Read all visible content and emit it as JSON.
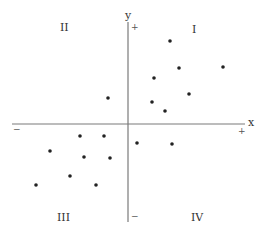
{
  "diagram": {
    "title": "",
    "axes": {
      "x_label": "x",
      "y_label": "y",
      "x_positive": "+",
      "x_negative": "−",
      "y_positive": "+",
      "y_negative": "−"
    },
    "quadrants": [
      {
        "id": "I",
        "label": "I"
      },
      {
        "id": "II",
        "label": "II"
      },
      {
        "id": "III",
        "label": "III"
      },
      {
        "id": "IV",
        "label": "IV"
      }
    ],
    "colors": {
      "axis": "#7a7a7a",
      "point": "#222222",
      "text": "#333333"
    },
    "points_px": [
      [
        170,
        41
      ],
      [
        179,
        68
      ],
      [
        223,
        67
      ],
      [
        154,
        78
      ],
      [
        189,
        94
      ],
      [
        152,
        102
      ],
      [
        165,
        111
      ],
      [
        108,
        98
      ],
      [
        80,
        136
      ],
      [
        104,
        136
      ],
      [
        50,
        151
      ],
      [
        84,
        157
      ],
      [
        110,
        158
      ],
      [
        70,
        176
      ],
      [
        36,
        185
      ],
      [
        96,
        185
      ],
      [
        137,
        143
      ],
      [
        172,
        144
      ]
    ]
  }
}
